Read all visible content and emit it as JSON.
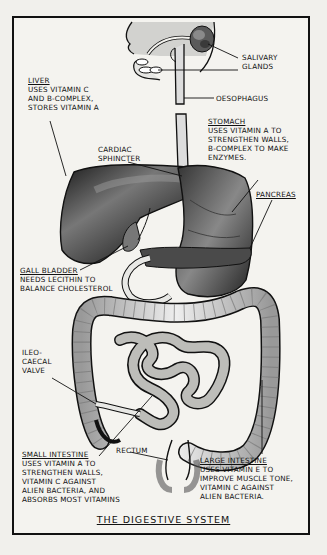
{
  "header": {
    "text": ""
  },
  "diagram": {
    "title": "THE DIGESTIVE SYSTEM",
    "labels": {
      "salivary_glands": {
        "title": "",
        "desc": "SALIVARY\nGLANDS"
      },
      "oesophagus": {
        "title": "",
        "desc": "OESOPHAGUS"
      },
      "liver": {
        "title": "LIVER",
        "desc": "USES VITAMIN C\nAND B-COMPLEX,\nSTORES VITAMIN A"
      },
      "stomach": {
        "title": "STOMACH",
        "desc": "USES VITAMIN A TO\nSTRENGTHEN WALLS,\nB-COMPLEX TO MAKE\nENZYMES."
      },
      "cardiac_sphincter": {
        "title": "",
        "desc": "CARDIAC\nSPHINCTER"
      },
      "pancreas": {
        "title": "PANCREAS",
        "desc": ""
      },
      "gall_bladder": {
        "title": "GALL BLADDER",
        "desc": "NEEDS LECITHIN TO\nBALANCE CHOLESTEROL"
      },
      "ileo_caecal_valve": {
        "title": "",
        "desc": "ILEO-\nCAECAL\nVALVE"
      },
      "rectum": {
        "title": "",
        "desc": "RECTUM"
      },
      "small_intestine": {
        "title": "SMALL INTESTINE",
        "desc": "USES VITAMIN A TO\nSTRENGTHEN WALLS,\nVITAMIN C AGAINST\nALIEN BACTERIA, AND\nABSORBS MOST VITAMINS"
      },
      "large_intestine": {
        "title": "LARGE INTESTINE",
        "desc": "USES VITAMIN E TO\nIMPROVE MUSCLE TONE,\nVITAMIN C AGAINST\nALIEN BACTERIA."
      }
    },
    "colors": {
      "ink": "#111111",
      "paper": "#f4f3ef",
      "organ_dark": "#2a2a2a",
      "organ_mid": "#6b6b6b",
      "organ_light": "#d8d8d4"
    }
  }
}
